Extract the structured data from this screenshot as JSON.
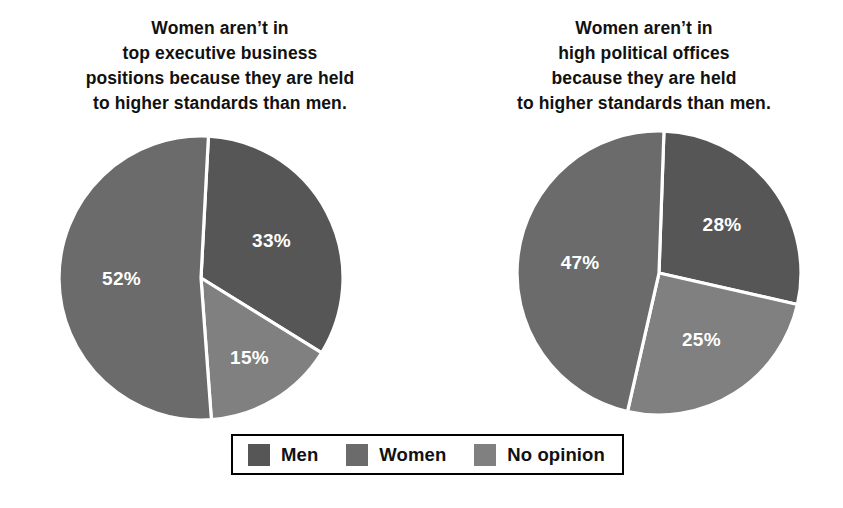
{
  "chart_data": [
    {
      "type": "pie",
      "id": "business",
      "title": "Women aren’t in\ntop executive business\npositions because they are held\nto higher standards than men.",
      "categories": [
        "Men",
        "Women",
        "No opinion"
      ],
      "values": [
        33,
        52,
        15
      ],
      "labels": [
        "33%",
        "52%",
        "15%"
      ],
      "colors": [
        "#565656",
        "#6b6b6b",
        "#808080"
      ],
      "start_angle_deg": 3,
      "direction": "clockwise",
      "slice_order": [
        "Men",
        "No opinion",
        "Women"
      ],
      "legend_position": "bottom",
      "grid": false,
      "xlabel": "",
      "ylabel": ""
    },
    {
      "type": "pie",
      "id": "political",
      "title": "Women aren’t in\nhigh political offices\nbecause they are held\nto higher standards than men.",
      "categories": [
        "Men",
        "Women",
        "No opinion"
      ],
      "values": [
        28,
        47,
        25
      ],
      "labels": [
        "28%",
        "47%",
        "25%"
      ],
      "colors": [
        "#565656",
        "#6b6b6b",
        "#808080"
      ],
      "start_angle_deg": 2,
      "direction": "clockwise",
      "slice_order": [
        "Men",
        "No opinion",
        "Women"
      ],
      "legend_position": "bottom",
      "grid": false,
      "xlabel": "",
      "ylabel": ""
    }
  ],
  "titles": {
    "left": "Women aren’t in\ntop executive business\npositions because they are held\nto higher standards than men.",
    "right": "Women aren’t in\nhigh political offices\nbecause they are held\nto higher standards than men."
  },
  "left_chart": {
    "slices": [
      {
        "name": "Men",
        "label": "33%",
        "value": 33,
        "color": "#565656"
      },
      {
        "name": "No opinion",
        "label": "15%",
        "value": 15,
        "color": "#808080"
      },
      {
        "name": "Women",
        "label": "52%",
        "value": 52,
        "color": "#6b6b6b"
      }
    ]
  },
  "right_chart": {
    "slices": [
      {
        "name": "Men",
        "label": "28%",
        "value": 28,
        "color": "#565656"
      },
      {
        "name": "No opinion",
        "label": "25%",
        "value": 25,
        "color": "#808080"
      },
      {
        "name": "Women",
        "label": "47%",
        "value": 47,
        "color": "#6b6b6b"
      }
    ]
  },
  "legend": {
    "items": [
      {
        "label": "Men",
        "color": "#565656"
      },
      {
        "label": "Women",
        "color": "#6b6b6b"
      },
      {
        "label": "No opinion",
        "color": "#808080"
      }
    ]
  },
  "style": {
    "background": "#ffffff",
    "separator_color": "#ffffff",
    "text_color": "#111111",
    "label_color": "#ffffff",
    "legend_border_color": "#000000"
  }
}
